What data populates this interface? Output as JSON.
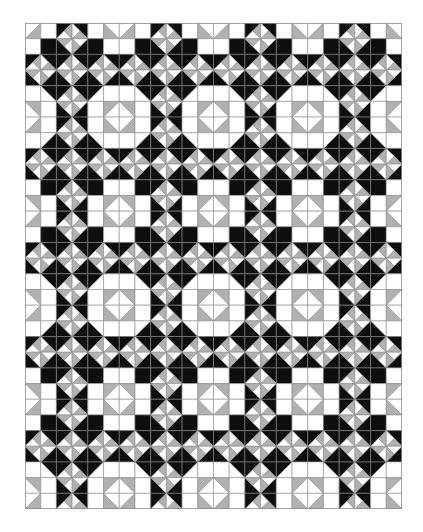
{
  "quilt": {
    "cols": 24,
    "rows": 31,
    "width_px": 377,
    "height_px": 486,
    "row_offset": 0,
    "col_offset": 0,
    "colors": {
      "white": "#ffffff",
      "gray": "#b1b1b1",
      "black": "#0e0e0e",
      "line": "#8a8a8a"
    },
    "tile": {
      "period_cols": 6,
      "period_rows": 12,
      "cells": [
        [
          "Glr",
          "W",
          "Pbr",
          "Pbl",
          "W",
          "Gll"
        ],
        [
          "W",
          "K",
          "Ptr",
          "Ptl",
          "K",
          "W"
        ],
        [
          "Pbr",
          "Pbl",
          "Pbr",
          "Pbl",
          "Pbr",
          "Pbl"
        ],
        [
          "Ptr",
          "Ptl",
          "Ptr",
          "Ptl",
          "Ptr",
          "Ptl"
        ],
        [
          "W",
          "Kur",
          "Pbr",
          "Pbl",
          "Kul",
          "W"
        ],
        [
          "Gur",
          "W",
          "Ptr",
          "Ptl",
          "W",
          "Gul"
        ],
        [
          "Glr",
          "W",
          "Pbr",
          "Pbl",
          "W",
          "Gll"
        ],
        [
          "W",
          "Klr",
          "Ptr",
          "Ptl",
          "Kll",
          "W"
        ],
        [
          "Pbr",
          "Pbl",
          "Pbr",
          "Pbl",
          "Pbr",
          "Pbl"
        ],
        [
          "Ptr",
          "Ptl",
          "Ptr",
          "Ptl",
          "Ptr",
          "Ptl"
        ],
        [
          "W",
          "K",
          "Pbr",
          "Pbl",
          "K",
          "W"
        ],
        [
          "Gur",
          "W",
          "Ptr",
          "Ptl",
          "W",
          "Gul"
        ]
      ]
    },
    "motifs": [
      {
        "name": "pinwheel",
        "description": "8-slice white/gray diamond on black"
      },
      {
        "name": "octagon",
        "description": "large white octagon with gray-cornered center diamond"
      },
      {
        "name": "cross-block",
        "description": "small white cross with gray-cornered center diamond"
      }
    ]
  }
}
